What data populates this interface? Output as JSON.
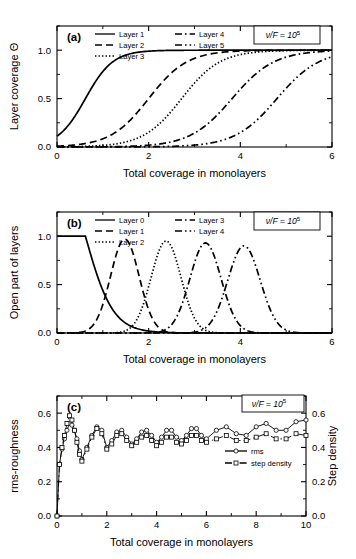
{
  "figure": {
    "background": "#ffffff",
    "ink": "#000000",
    "panels": [
      "a",
      "b",
      "c"
    ]
  },
  "chart_data": [
    {
      "panel_label": "(a)",
      "type": "line",
      "title": "",
      "xlabel": "Total coverage in monolayers",
      "ylabel": "Layer coverage Θ",
      "xlim": [
        0,
        6
      ],
      "ylim": [
        0,
        1.25
      ],
      "xticks": [
        0,
        2,
        4,
        6
      ],
      "xticklabels": [
        "0",
        "2",
        "4",
        "6"
      ],
      "xminorticks": [
        1,
        3,
        5
      ],
      "yticks": [
        0.0,
        0.5,
        1.0
      ],
      "yticklabels": [
        "0.0",
        "0.5",
        "1.0"
      ],
      "yminorticks": [
        0.25,
        0.75,
        1.25
      ],
      "grid": false,
      "annotation": "ν/F = 10",
      "annotation_exponent": "5",
      "legend_position": "top-left",
      "series": [
        {
          "name": "Layer 1",
          "dash": "solid",
          "midpoint": 0.62,
          "width": 0.3,
          "plateau": 1.0
        },
        {
          "name": "Layer 2",
          "dash": "dash",
          "midpoint": 2.0,
          "width": 0.42,
          "plateau": 1.0
        },
        {
          "name": "Layer 3",
          "dash": "dot",
          "midpoint": 2.72,
          "width": 0.42,
          "plateau": 1.0
        },
        {
          "name": "Layer 4",
          "dash": "dashdot",
          "midpoint": 3.82,
          "width": 0.46,
          "plateau": 1.0
        },
        {
          "name": "Layer 5",
          "dash": "dashdotdot",
          "midpoint": 4.8,
          "width": 0.46,
          "plateau": 1.0
        }
      ]
    },
    {
      "panel_label": "(b)",
      "type": "line",
      "title": "",
      "xlabel": "Total coverage in monolayers",
      "ylabel": "Open part of layers",
      "xlim": [
        0,
        6
      ],
      "ylim": [
        0,
        1.25
      ],
      "xticks": [
        0,
        2,
        4,
        6
      ],
      "xticklabels": [
        "0",
        "2",
        "4",
        "6"
      ],
      "xminorticks": [
        1,
        3,
        5
      ],
      "yticks": [
        0.0,
        0.5,
        1.0
      ],
      "yticklabels": [
        "0.0",
        "0.5",
        "1.0"
      ],
      "yminorticks": [
        0.25,
        0.75,
        1.25
      ],
      "grid": false,
      "annotation": "ν/F = 10",
      "annotation_exponent": "5",
      "legend_position": "top-left",
      "series": [
        {
          "name": "Layer 0",
          "dash": "solid",
          "kind": "decay",
          "midpoint": 0.62,
          "width": 0.3,
          "peak": 1.0
        },
        {
          "name": "Layer 1",
          "dash": "dash",
          "kind": "peak",
          "midpoint": 1.48,
          "width": 0.44,
          "peak": 0.97
        },
        {
          "name": "Layer 2",
          "dash": "dot",
          "kind": "peak",
          "midpoint": 2.38,
          "width": 0.46,
          "peak": 0.95
        },
        {
          "name": "Layer 3",
          "dash": "dashdot",
          "kind": "peak",
          "midpoint": 3.24,
          "width": 0.48,
          "peak": 0.93
        },
        {
          "name": "Layer 4",
          "dash": "dashdotdot",
          "kind": "peak",
          "midpoint": 4.08,
          "width": 0.5,
          "peak": 0.9
        }
      ]
    },
    {
      "panel_label": "(c)",
      "type": "line",
      "title": "",
      "xlabel": "Total coverage in monolayers",
      "ylabel": "rms-roughness",
      "ylabel_right": "Step density",
      "xlim": [
        0,
        10
      ],
      "ylim": [
        0,
        0.7
      ],
      "ylim_right": [
        0,
        0.7
      ],
      "xticks": [
        0,
        2,
        4,
        6,
        8,
        10
      ],
      "xticklabels": [
        "0",
        "2",
        "4",
        "6",
        "8",
        "10"
      ],
      "xminorticks": [
        1,
        3,
        5,
        7,
        9
      ],
      "yticks": [
        0.0,
        0.2,
        0.4,
        0.6
      ],
      "yticklabels": [
        "0.0",
        "0.2",
        "0.4",
        "0.6"
      ],
      "yticklabels_right": [
        "0.0",
        "0.2",
        "0.4",
        "0.6"
      ],
      "yminorticks": [
        0.1,
        0.3,
        0.5,
        0.7
      ],
      "grid": false,
      "annotation": "ν/F = 10",
      "annotation_exponent": "5",
      "legend_position": "center-right",
      "series": [
        {
          "name": "rms",
          "dash": "solid",
          "marker": "circle",
          "baseline": 0.47,
          "amplitude": 0.055,
          "period": 1.0,
          "phase": 0.45,
          "drift": 0.009,
          "rise_x": 0.22,
          "transient_peak": 0.545,
          "x": [
            0.0,
            0.1,
            0.2,
            0.3,
            0.4,
            0.5,
            0.6,
            0.7,
            0.8,
            0.9,
            1.0,
            1.2,
            1.4,
            1.6,
            1.8,
            2.0,
            2.2,
            2.4,
            2.6,
            2.8,
            3.0,
            3.2,
            3.4,
            3.6,
            3.8,
            4.0,
            4.2,
            4.4,
            4.6,
            4.8,
            5.0,
            5.2,
            5.4,
            5.6,
            5.8,
            6.0,
            6.4,
            6.8,
            7.2,
            7.6,
            8.0,
            8.4,
            8.8,
            9.2,
            9.6,
            10.0
          ],
          "y": [
            0.0,
            0.3,
            0.39,
            0.45,
            0.5,
            0.54,
            0.53,
            0.5,
            0.45,
            0.38,
            0.33,
            0.4,
            0.47,
            0.52,
            0.5,
            0.4,
            0.44,
            0.49,
            0.5,
            0.46,
            0.42,
            0.45,
            0.49,
            0.5,
            0.47,
            0.43,
            0.46,
            0.5,
            0.5,
            0.46,
            0.44,
            0.47,
            0.51,
            0.51,
            0.47,
            0.45,
            0.5,
            0.52,
            0.48,
            0.47,
            0.52,
            0.54,
            0.5,
            0.5,
            0.55,
            0.56
          ]
        },
        {
          "name": "step density",
          "dash": "dashdot",
          "marker": "square",
          "baseline": 0.42,
          "amplitude": 0.055,
          "period": 1.0,
          "phase": 0.45,
          "drift": 0.006,
          "rise_x": 0.22,
          "transient_peak": 0.585,
          "x": [
            0.0,
            0.1,
            0.2,
            0.3,
            0.4,
            0.5,
            0.6,
            0.7,
            0.8,
            0.9,
            1.0,
            1.2,
            1.4,
            1.6,
            1.8,
            2.0,
            2.2,
            2.4,
            2.6,
            2.8,
            3.0,
            3.2,
            3.4,
            3.6,
            3.8,
            4.0,
            4.2,
            4.4,
            4.6,
            4.8,
            5.0,
            5.2,
            5.4,
            5.6,
            5.8,
            6.0,
            6.4,
            6.8,
            7.2,
            7.6,
            8.0,
            8.4,
            8.8,
            9.2,
            9.6,
            10.0
          ],
          "y": [
            0.0,
            0.3,
            0.4,
            0.47,
            0.54,
            0.585,
            0.56,
            0.5,
            0.43,
            0.36,
            0.32,
            0.39,
            0.46,
            0.51,
            0.48,
            0.39,
            0.42,
            0.47,
            0.48,
            0.44,
            0.41,
            0.43,
            0.46,
            0.47,
            0.44,
            0.41,
            0.43,
            0.46,
            0.46,
            0.43,
            0.42,
            0.44,
            0.47,
            0.47,
            0.44,
            0.43,
            0.45,
            0.47,
            0.44,
            0.44,
            0.46,
            0.48,
            0.45,
            0.45,
            0.48,
            0.47
          ]
        }
      ]
    }
  ]
}
